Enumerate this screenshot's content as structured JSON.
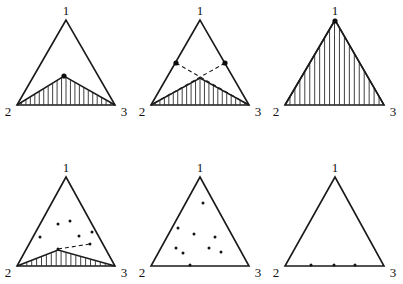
{
  "figure": {
    "title": "",
    "background_color": "#ffffff",
    "ink_color": "#1a1a1a",
    "grid": {
      "rows": 2,
      "cols": 3
    },
    "vertex_labels": {
      "apex": "1",
      "bottom_left": "2",
      "bottom_right": "3"
    }
  },
  "chart_data": {
    "type": "scatter",
    "title": "",
    "xlabel": "",
    "ylabel": "",
    "panels": [
      {
        "id": "panel-1",
        "index": 1,
        "label": "",
        "triangle": {
          "apex": [
            66,
            20
          ],
          "left": [
            17,
            105
          ],
          "right": [
            115,
            105
          ]
        },
        "hatched_region": {
          "present": true,
          "style": "vertical-hatch",
          "vertices": [
            [
              64,
              76
            ],
            [
              17,
              105
            ],
            [
              115,
              105
            ]
          ],
          "hatch_count": 22
        },
        "dashed_lines": [],
        "points": [
          {
            "x": 64,
            "y": 76,
            "size": "large"
          }
        ],
        "point_count": 1
      },
      {
        "id": "panel-2",
        "index": 2,
        "label": "",
        "triangle": {
          "apex": [
            200,
            20
          ],
          "left": [
            151,
            105
          ],
          "right": [
            249,
            105
          ]
        },
        "hatched_region": {
          "present": true,
          "style": "vertical-hatch",
          "vertices": [
            [
              200,
              78
            ],
            [
              151,
              105
            ],
            [
              249,
              105
            ]
          ],
          "hatch_count": 22
        },
        "dashed_lines": [
          {
            "from": [
              176,
              63
            ],
            "to": [
              249,
              105
            ]
          },
          {
            "from": [
              225,
              63
            ],
            "to": [
              151,
              105
            ]
          }
        ],
        "points": [
          {
            "x": 176,
            "y": 63,
            "size": "large"
          },
          {
            "x": 225,
            "y": 63,
            "size": "large"
          }
        ],
        "point_count": 2
      },
      {
        "id": "panel-3",
        "index": 3,
        "label": "",
        "triangle": {
          "apex": [
            335,
            20
          ],
          "left": [
            285,
            105
          ],
          "right": [
            384,
            105
          ]
        },
        "hatched_region": {
          "present": true,
          "style": "vertical-hatch",
          "vertices": [
            [
              335,
              20
            ],
            [
              285,
              105
            ],
            [
              384,
              105
            ]
          ],
          "hatch_count": 20
        },
        "dashed_lines": [],
        "points": [
          {
            "x": 335,
            "y": 21,
            "size": "large"
          }
        ],
        "point_count": 1
      },
      {
        "id": "panel-4",
        "index": 4,
        "label": "",
        "triangle": {
          "apex": [
            66,
            177
          ],
          "left": [
            17,
            266
          ],
          "right": [
            115,
            266
          ]
        },
        "hatched_region": {
          "present": true,
          "style": "vertical-hatch-sliver",
          "vertices": [
            [
              58,
              250
            ],
            [
              17,
              266
            ],
            [
              115,
              266
            ]
          ],
          "hatch_count": 20
        },
        "dashed_lines": [
          {
            "from": [
              58,
              249
            ],
            "to": [
              90,
              244
            ]
          }
        ],
        "points": [
          {
            "x": 58,
            "y": 224,
            "size": "small"
          },
          {
            "x": 70,
            "y": 221,
            "size": "small"
          },
          {
            "x": 40,
            "y": 237,
            "size": "small"
          },
          {
            "x": 79,
            "y": 236,
            "size": "small"
          },
          {
            "x": 92,
            "y": 232,
            "size": "small"
          },
          {
            "x": 58,
            "y": 249,
            "size": "small"
          },
          {
            "x": 90,
            "y": 244,
            "size": "small"
          }
        ],
        "point_count": 7
      },
      {
        "id": "panel-5",
        "index": 5,
        "label": "",
        "triangle": {
          "apex": [
            200,
            177
          ],
          "left": [
            151,
            266
          ],
          "right": [
            249,
            266
          ]
        },
        "hatched_region": {
          "present": false,
          "style": "none",
          "vertices": [],
          "hatch_count": 0
        },
        "dashed_lines": [],
        "points": [
          {
            "x": 203,
            "y": 203,
            "size": "small"
          },
          {
            "x": 178,
            "y": 228,
            "size": "small"
          },
          {
            "x": 194,
            "y": 234,
            "size": "small"
          },
          {
            "x": 215,
            "y": 237,
            "size": "small"
          },
          {
            "x": 176,
            "y": 248,
            "size": "small"
          },
          {
            "x": 209,
            "y": 248,
            "size": "small"
          },
          {
            "x": 183,
            "y": 253,
            "size": "small"
          },
          {
            "x": 221,
            "y": 252,
            "size": "small"
          },
          {
            "x": 190,
            "y": 265,
            "size": "small"
          }
        ],
        "point_count": 9
      },
      {
        "id": "panel-6",
        "index": 6,
        "label": "",
        "triangle": {
          "apex": [
            335,
            177
          ],
          "left": [
            285,
            266
          ],
          "right": [
            384,
            266
          ]
        },
        "hatched_region": {
          "present": false,
          "style": "none",
          "vertices": [],
          "hatch_count": 0
        },
        "dashed_lines": [],
        "points": [
          {
            "x": 311,
            "y": 265,
            "size": "small"
          },
          {
            "x": 334,
            "y": 265,
            "size": "small"
          },
          {
            "x": 355,
            "y": 265,
            "size": "small"
          }
        ],
        "point_count": 3
      }
    ]
  }
}
